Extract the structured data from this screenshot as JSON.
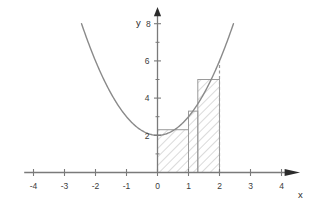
{
  "chart_data": {
    "type": "line",
    "title": "",
    "xlabel": "x",
    "ylabel": "y",
    "xlim": [
      -4,
      4
    ],
    "ylim": [
      0,
      8
    ],
    "grid": false,
    "legend": null,
    "x_ticks": [
      -4,
      -3,
      -2,
      -1,
      0,
      1,
      2,
      3,
      4
    ],
    "x_tick_labels": [
      "-4",
      "-3",
      "-2",
      "-1",
      "0",
      "1",
      "2",
      "3",
      "4"
    ],
    "y_ticks": [
      2,
      4,
      6,
      8
    ],
    "y_tick_labels": [
      "2",
      "4",
      "6",
      "8"
    ],
    "y_minor_ticks": [
      1,
      3,
      5,
      7
    ],
    "series": [
      {
        "name": "f(x) = x^2 + 2",
        "type": "curve",
        "color": "#8a8a8a",
        "x_start": -2.45,
        "x_end": 2.45,
        "coefficients": {
          "a": 1,
          "b": 0,
          "c": 2
        },
        "points": [
          {
            "x": -2.45,
            "y": 8.0
          },
          {
            "x": -2.0,
            "y": 6.0
          },
          {
            "x": -1.5,
            "y": 4.25
          },
          {
            "x": -1.0,
            "y": 3.0
          },
          {
            "x": -0.5,
            "y": 2.25
          },
          {
            "x": 0.0,
            "y": 2.0
          },
          {
            "x": 0.5,
            "y": 2.25
          },
          {
            "x": 1.0,
            "y": 3.0
          },
          {
            "x": 1.5,
            "y": 4.25
          },
          {
            "x": 2.0,
            "y": 6.0
          },
          {
            "x": 2.45,
            "y": 8.0
          }
        ]
      }
    ],
    "riemann_rectangles": {
      "color": "#8a8a8a",
      "fill": "hatch-diagonal",
      "integration_interval": [
        0,
        2
      ],
      "bars": [
        {
          "x0": 0.0,
          "x1": 1.0,
          "height": 2.3
        },
        {
          "x0": 1.0,
          "x1": 1.3,
          "height": 3.3
        },
        {
          "x0": 1.3,
          "x1": 2.0,
          "height": 5.0
        }
      ]
    },
    "annotations": [
      {
        "name": "dashed-vertical-at-x2",
        "type": "dashed-line",
        "x": 2,
        "y_from": 0,
        "y_to": 6.0
      }
    ]
  },
  "axes": {
    "x_axis_label": "x",
    "y_axis_label": "y",
    "y_top_label": "8",
    "arrow_color": "#2b2b2b",
    "axis_color": "#7a7a7a"
  },
  "colors": {
    "curve": "#8a8a8a",
    "rect_stroke": "#9a9a9a",
    "hatch": "#b5b5b5",
    "axis": "#7a7a7a",
    "text": "#3b3b3b",
    "background": "#ffffff"
  }
}
